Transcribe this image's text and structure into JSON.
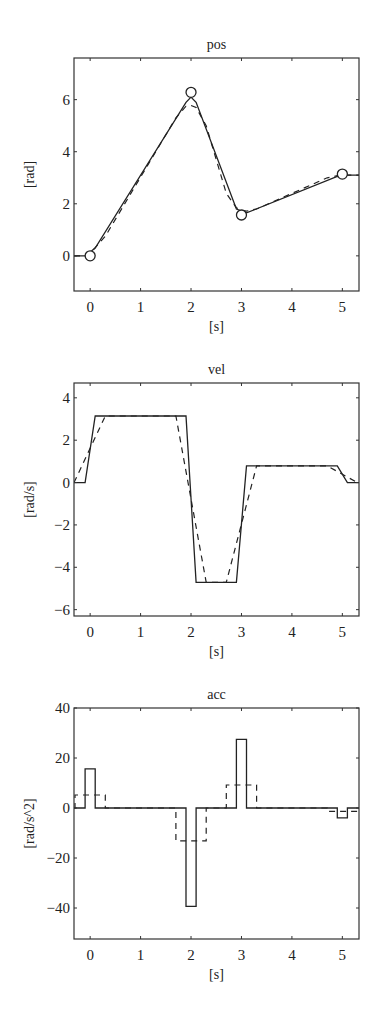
{
  "chart_data": [
    {
      "type": "line",
      "title": "pos",
      "xlabel": "[s]",
      "ylabel": "[rad]",
      "xlim": [
        -0.32,
        5.33
      ],
      "ylim": [
        -1.35,
        7.6
      ],
      "xticks": [
        0,
        1,
        2,
        3,
        4,
        5
      ],
      "yticks": [
        0,
        2,
        4,
        6
      ],
      "grid": false,
      "box": {
        "left": 74,
        "top": 58,
        "right": 359,
        "bottom": 291
      },
      "markers": {
        "x": [
          0,
          2,
          3,
          5
        ],
        "y": [
          0,
          6.28,
          1.57,
          3.14
        ],
        "shape": "circle"
      },
      "series": [
        {
          "name": "solid",
          "style": "solid",
          "x": [
            -0.32,
            -0.1,
            0.1,
            1.9,
            2.0,
            2.1,
            2.9,
            3.1,
            4.9,
            5.1,
            5.33
          ],
          "y": [
            0.0,
            0.0,
            0.3,
            5.9,
            6.1,
            5.9,
            1.8,
            1.65,
            3.05,
            3.1,
            3.1
          ]
        },
        {
          "name": "dashed",
          "style": "dashed",
          "x": [
            -0.32,
            -0.1,
            0.0,
            0.3,
            1.7,
            1.9,
            2.0,
            2.1,
            2.3,
            2.7,
            2.9,
            3.0,
            3.1,
            3.3,
            4.7,
            4.9,
            5.0,
            5.1,
            5.33
          ],
          "y": [
            0.0,
            0.0,
            0.1,
            0.75,
            5.3,
            5.75,
            5.78,
            5.7,
            5.0,
            2.4,
            1.85,
            1.75,
            1.72,
            1.8,
            3.0,
            3.08,
            3.1,
            3.1,
            3.1
          ]
        }
      ]
    },
    {
      "type": "line",
      "title": "vel",
      "xlabel": "[s]",
      "ylabel": "[rad/s]",
      "xlim": [
        -0.32,
        5.33
      ],
      "ylim": [
        -6.3,
        4.7
      ],
      "xticks": [
        0,
        1,
        2,
        3,
        4,
        5
      ],
      "yticks": [
        -6,
        -4,
        -2,
        0,
        2,
        4
      ],
      "grid": false,
      "box": {
        "left": 74,
        "top": 383,
        "right": 359,
        "bottom": 616
      },
      "series": [
        {
          "name": "solid",
          "style": "solid",
          "x": [
            -0.32,
            -0.1,
            0.1,
            1.9,
            2.1,
            2.9,
            3.1,
            4.9,
            5.1,
            5.33
          ],
          "y": [
            0.0,
            0.0,
            3.14,
            3.14,
            -4.71,
            -4.71,
            0.785,
            0.785,
            0.0,
            0.0
          ]
        },
        {
          "name": "dashed",
          "style": "dashed",
          "x": [
            -0.32,
            0.3,
            1.7,
            2.3,
            2.7,
            3.3,
            4.7,
            5.3
          ],
          "y": [
            0.0,
            3.14,
            3.14,
            -4.71,
            -4.71,
            0.785,
            0.785,
            0.0
          ]
        }
      ]
    },
    {
      "type": "line",
      "title": "acc",
      "xlabel": "[s]",
      "ylabel": "[rad/s^2]",
      "xlim": [
        -0.32,
        5.33
      ],
      "ylim": [
        -52.4,
        40
      ],
      "xticks": [
        0,
        1,
        2,
        3,
        4,
        5
      ],
      "yticks": [
        -40,
        -20,
        0,
        20,
        40
      ],
      "grid": false,
      "box": {
        "left": 74,
        "top": 708,
        "right": 359,
        "bottom": 939
      },
      "series": [
        {
          "name": "solid",
          "style": "solid",
          "x": [
            -0.32,
            -0.1,
            -0.1,
            0.1,
            0.1,
            1.9,
            1.9,
            2.1,
            2.1,
            2.9,
            2.9,
            3.1,
            3.1,
            4.9,
            4.9,
            5.1,
            5.1,
            5.33
          ],
          "y": [
            0,
            0,
            15.7,
            15.7,
            0,
            0,
            -39.3,
            -39.3,
            0,
            0,
            27.5,
            27.5,
            0,
            0,
            -3.9,
            -3.9,
            0,
            0
          ]
        },
        {
          "name": "dashed",
          "style": "dashed",
          "x": [
            -0.32,
            -0.3,
            -0.3,
            0.3,
            0.3,
            1.7,
            1.7,
            2.3,
            2.3,
            2.7,
            2.7,
            3.3,
            3.3,
            4.7,
            4.7,
            5.3,
            5.3,
            5.33
          ],
          "y": [
            0,
            0,
            5.2,
            5.2,
            0,
            0,
            -13.1,
            -13.1,
            0,
            0,
            9.2,
            9.2,
            0,
            0,
            -1.3,
            -1.3,
            0,
            0
          ]
        }
      ]
    }
  ]
}
